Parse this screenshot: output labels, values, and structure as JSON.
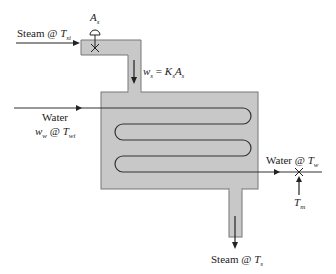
{
  "diagram": {
    "colors": {
      "vessel_fill": "#c8c8c8",
      "vessel_stroke": "#777777",
      "line": "#222222"
    },
    "labels": {
      "valve": {
        "main": "A",
        "sub": "s"
      },
      "steam_in": {
        "text": "Steam @ ",
        "var": "T",
        "sub": "si"
      },
      "steam_flow": {
        "lhs": "w",
        "lhs_sub": "s",
        "eq": " = ",
        "k": "K",
        "k_sub": "s",
        "a": "A",
        "a_sub": "s"
      },
      "water_in_line1": "Water",
      "water_in_line2": {
        "w": "w",
        "w_sub": "w",
        "at": " @ ",
        "t": "T",
        "t_sub": "wi"
      },
      "water_out": {
        "text": "Water @ ",
        "var": "T",
        "sub": "w"
      },
      "sensor": {
        "var": "T",
        "sub": "m"
      },
      "steam_out": {
        "text": "Steam @ ",
        "var": "T",
        "sub": "s"
      }
    }
  }
}
